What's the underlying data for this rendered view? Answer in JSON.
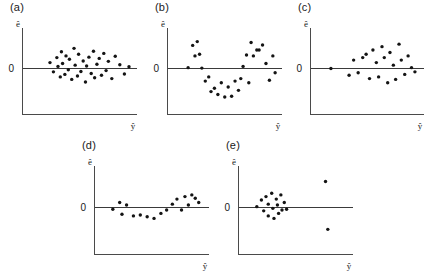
{
  "figure": {
    "type": "multi-panel-scatter",
    "panel_count": 5,
    "axis": {
      "y_label": "ê",
      "x_label": "ŷ",
      "zero_tick_label": "0"
    },
    "colors": {
      "point": "#141414",
      "axis": "#4a4a4a",
      "zero_line": "#3a3a3a",
      "background": "#ffffff"
    }
  },
  "panels": [
    {
      "id": "a",
      "label": "(a)"
    },
    {
      "id": "b",
      "label": "(b)"
    },
    {
      "id": "c",
      "label": "(c)"
    },
    {
      "id": "d",
      "label": "(d)"
    },
    {
      "id": "e",
      "label": "(e)"
    }
  ],
  "chart_data": [
    {
      "type": "scatter",
      "title": "(a)",
      "xlabel": "ŷ",
      "ylabel": "ê",
      "xlim": [
        0,
        100
      ],
      "ylim": [
        -100,
        100
      ],
      "grid": false,
      "legend": null,
      "annotations": [
        "0"
      ],
      "x": [
        24,
        27,
        30,
        31,
        33,
        34,
        35,
        37,
        38,
        40,
        41,
        43,
        45,
        46,
        48,
        49,
        51,
        53,
        55,
        56,
        58,
        60,
        62,
        63,
        65,
        67,
        69,
        71,
        73,
        75,
        78,
        81,
        85,
        89,
        93
      ],
      "y": [
        14,
        -8,
        26,
        5,
        -20,
        40,
        12,
        -14,
        30,
        -3,
        22,
        -26,
        48,
        8,
        -18,
        34,
        -7,
        18,
        -32,
        6,
        27,
        -12,
        41,
        -22,
        10,
        24,
        -16,
        36,
        -5,
        17,
        -24,
        29,
        9,
        -13,
        4
      ]
    },
    {
      "type": "scatter",
      "title": "(b)",
      "xlabel": "ŷ",
      "ylabel": "ê",
      "xlim": [
        0,
        100
      ],
      "ylim": [
        -100,
        100
      ],
      "grid": false,
      "legend": null,
      "annotations": [
        "0"
      ],
      "x": [
        18,
        22,
        24,
        26,
        28,
        30,
        33,
        36,
        38,
        41,
        44,
        47,
        50,
        53,
        56,
        59,
        62,
        64,
        66,
        69,
        71,
        73,
        75,
        78,
        80,
        83,
        86,
        89,
        92,
        94
      ],
      "y": [
        2,
        55,
        30,
        64,
        34,
        1,
        -30,
        -20,
        -55,
        -47,
        -62,
        -34,
        -68,
        -44,
        -66,
        -30,
        -52,
        -24,
        5,
        32,
        -34,
        62,
        30,
        44,
        44,
        56,
        12,
        -28,
        30,
        -10
      ]
    },
    {
      "type": "scatter",
      "title": "(c)",
      "xlabel": "ŷ",
      "ylabel": "ê",
      "xlim": [
        0,
        100
      ],
      "ylim": [
        -100,
        100
      ],
      "grid": false,
      "legend": null,
      "annotations": [
        "0"
      ],
      "x": [
        18,
        34,
        38,
        42,
        46,
        49,
        52,
        55,
        58,
        60,
        63,
        65,
        68,
        70,
        73,
        75,
        78,
        80,
        83,
        86,
        89,
        92
      ],
      "y": [
        0,
        -16,
        20,
        -10,
        26,
        34,
        -24,
        44,
        14,
        -20,
        52,
        26,
        -34,
        38,
        8,
        -26,
        58,
        20,
        -14,
        30,
        2,
        -8
      ]
    },
    {
      "type": "scatter",
      "title": "(d)",
      "xlabel": "ŷ",
      "ylabel": "ê",
      "xlim": [
        0,
        100
      ],
      "ylim": [
        -100,
        100
      ],
      "grid": false,
      "legend": null,
      "annotations": [
        "0"
      ],
      "x": [
        16,
        22,
        24,
        28,
        34,
        40,
        46,
        52,
        58,
        63,
        68,
        72,
        76,
        79,
        82,
        85,
        88,
        91
      ],
      "y": [
        -4,
        12,
        -16,
        6,
        -20,
        -18,
        -22,
        -26,
        -14,
        -6,
        8,
        20,
        -6,
        26,
        6,
        30,
        22,
        12
      ]
    },
    {
      "type": "scatter",
      "title": "(e)",
      "xlabel": "ŷ",
      "ylabel": "ê",
      "xlim": [
        0,
        100
      ],
      "ylim": [
        -100,
        100
      ],
      "grid": false,
      "legend": null,
      "annotations": [
        "0"
      ],
      "x": [
        16,
        20,
        22,
        24,
        26,
        26,
        29,
        30,
        31,
        33,
        34,
        35,
        37,
        38,
        40,
        42,
        76,
        78
      ],
      "y": [
        2,
        18,
        -8,
        26,
        8,
        -20,
        34,
        -2,
        -26,
        20,
        6,
        -14,
        30,
        -6,
        12,
        -4,
        62,
        -52
      ]
    }
  ]
}
